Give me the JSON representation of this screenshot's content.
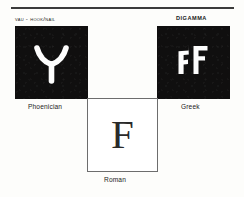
{
  "figure": {
    "rule": "horizontal-rule",
    "panels": [
      {
        "id": "phoenician",
        "top_caption": "vau - hook/nail",
        "bottom_caption": "Phoenician",
        "glyph_name": "phoenician-vau-glyph",
        "glyph_text": "Y",
        "background": "#100f0f",
        "ink": "#ffffff"
      },
      {
        "id": "greek",
        "top_caption": "DIGAMMA",
        "bottom_caption": "Greek",
        "glyph_name": "greek-digamma-glyph",
        "glyph_text": "ϜF",
        "background": "#100f0f",
        "ink": "#ffffff"
      },
      {
        "id": "roman",
        "top_caption": "",
        "bottom_caption": "Roman",
        "glyph_name": "roman-f-glyph",
        "glyph_text": "F",
        "background": "#ffffff",
        "ink": "#2a2a2a"
      }
    ]
  }
}
